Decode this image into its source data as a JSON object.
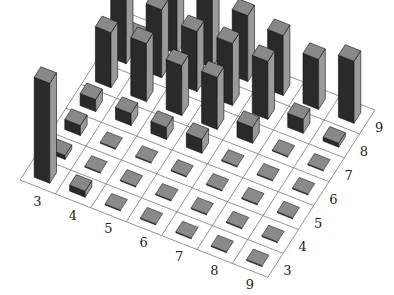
{
  "chart_data": {
    "type": "bar3d",
    "title": "",
    "xlabel": "",
    "ylabel": "",
    "zlabel": "",
    "x": [
      3,
      4,
      5,
      6,
      7,
      8,
      9
    ],
    "y": [
      3,
      4,
      5,
      6,
      7,
      8,
      9
    ],
    "x_tick_labels": [
      "3",
      "4",
      "5",
      "6",
      "7",
      "8",
      "9"
    ],
    "y_tick_labels": [
      "3",
      "4",
      "5",
      "6",
      "7",
      "8",
      "9"
    ],
    "grid": true,
    "heights_note": "relative bar heights (pixel-estimated), rows = y (3..9), columns = x (3..9)",
    "heights": [
      [
        100,
        6,
        1,
        1,
        1,
        1,
        1
      ],
      [
        4,
        1,
        1,
        1,
        1,
        1,
        1
      ],
      [
        10,
        1,
        1,
        1,
        1,
        1,
        1
      ],
      [
        12,
        12,
        12,
        14,
        1,
        1,
        1
      ],
      [
        55,
        58,
        50,
        52,
        16,
        1,
        1
      ],
      [
        72,
        68,
        60,
        62,
        58,
        14,
        4
      ],
      [
        1,
        78,
        70,
        66,
        60,
        50,
        62
      ]
    ],
    "colors": {
      "top": "#888888",
      "front": "#2a2a2a",
      "side": "#9a9a9a",
      "flat": "#8a8a8a",
      "grid": "#777777"
    }
  }
}
